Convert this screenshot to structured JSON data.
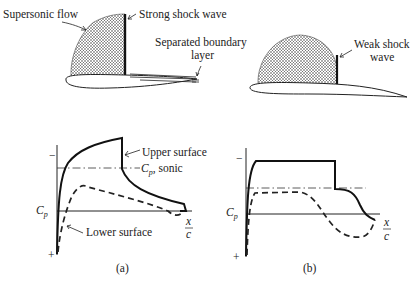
{
  "panel_a": {
    "caption": "(a)",
    "labels": {
      "supersonic_flow": "Supersonic flow",
      "strong_shock": "Strong shock wave",
      "separated_line1": "Separated boundary",
      "separated_line2": "layer",
      "upper_surface": "Upper surface",
      "cp_sonic_cp": "C",
      "cp_sonic_sub": "p",
      "cp_sonic_rest": ", sonic",
      "lower_surface": "Lower surface",
      "cp_axis": "C",
      "cp_axis_sub": "p",
      "minus": "−",
      "plus": "+",
      "x": "x",
      "c": "c"
    }
  },
  "panel_b": {
    "caption": "(b)",
    "labels": {
      "weak_shock_line1": "Weak shock",
      "weak_shock_line2": "wave",
      "cp_axis": "C",
      "cp_axis_sub": "p",
      "minus": "−",
      "plus": "+",
      "x": "x",
      "c": "c"
    }
  },
  "colors": {
    "ink": "#1a1a1a",
    "background": "#ffffff"
  }
}
